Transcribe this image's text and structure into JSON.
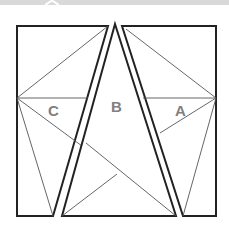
{
  "diagram": {
    "type": "geometric dissection of a square into three pieces",
    "labels": {
      "left": "C",
      "center": "B",
      "right": "A"
    },
    "colors": {
      "outline": "#222222",
      "inner_lines": "#555555",
      "label": "#808080",
      "background": "#ffffff",
      "top_strip": "#d9d9d9"
    }
  }
}
